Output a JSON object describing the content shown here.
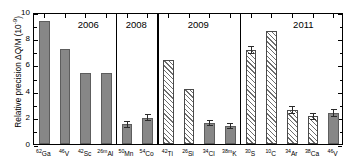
{
  "chart_data": {
    "type": "bar",
    "title": "",
    "xlabel": "",
    "ylabel": "Relative precision ΔQ/M (10⁻⁹)",
    "ylabel_text": "Relative precision ΔQ/M (10",
    "ylabel_exponent": "-9",
    "ylabel_suffix": ")",
    "ylim": [
      0,
      10
    ],
    "yticks": [
      0,
      2,
      4,
      6,
      8,
      10
    ],
    "ytick_labels": [
      "0",
      "2",
      "4",
      "6",
      "8",
      "10"
    ],
    "grid": false,
    "legend": "none",
    "categories": [
      "62Ga",
      "46V",
      "42Sc",
      "26mAl",
      "50Mn",
      "54Co",
      "42Ti",
      "26Si",
      "34Cl",
      "38mK",
      "30S",
      "10C",
      "34Ar",
      "38Ca",
      "46V"
    ],
    "values": [
      9.35,
      7.2,
      5.35,
      5.35,
      1.5,
      2.0,
      6.35,
      4.2,
      1.6,
      1.35,
      7.1,
      8.55,
      2.6,
      2.1,
      2.35
    ],
    "errors": [
      0,
      0,
      0,
      0,
      0.28,
      0.28,
      0,
      0,
      0.25,
      0.25,
      0.3,
      0,
      0.3,
      0.28,
      0.3
    ],
    "bar_styles": [
      "solid",
      "solid",
      "solid",
      "solid",
      "solid",
      "solid",
      "hatch",
      "hatch",
      "solid",
      "solid",
      "hatch",
      "hatch",
      "hatch",
      "hatch",
      "solid"
    ],
    "groups": [
      {
        "year": "2006",
        "start": 0,
        "end": 3
      },
      {
        "year": "2008",
        "start": 4,
        "end": 5
      },
      {
        "year": "2009",
        "start": 6,
        "end": 9
      },
      {
        "year": "2011",
        "start": 10,
        "end": 14
      }
    ],
    "bars": [
      {
        "mass": "62",
        "element": "Ga",
        "value": 9.35,
        "error": 0,
        "style": "solid",
        "group": "2006"
      },
      {
        "mass": "46",
        "element": "V",
        "value": 7.2,
        "error": 0,
        "style": "solid",
        "group": "2006"
      },
      {
        "mass": "42",
        "element": "Sc",
        "value": 5.35,
        "error": 0,
        "style": "solid",
        "group": "2006"
      },
      {
        "mass": "26m",
        "element": "Al",
        "value": 5.35,
        "error": 0,
        "style": "solid",
        "group": "2006"
      },
      {
        "mass": "50",
        "element": "Mn",
        "value": 1.5,
        "error": 0.28,
        "style": "solid",
        "group": "2008"
      },
      {
        "mass": "54",
        "element": "Co",
        "value": 2.0,
        "error": 0.28,
        "style": "solid",
        "group": "2008"
      },
      {
        "mass": "42",
        "element": "Ti",
        "value": 6.35,
        "error": 0,
        "style": "hatch",
        "group": "2009"
      },
      {
        "mass": "26",
        "element": "Si",
        "value": 4.2,
        "error": 0,
        "style": "hatch",
        "group": "2009"
      },
      {
        "mass": "34",
        "element": "Cl",
        "value": 1.6,
        "error": 0.25,
        "style": "solid",
        "group": "2009"
      },
      {
        "mass": "38m",
        "element": "K",
        "value": 1.35,
        "error": 0.25,
        "style": "solid",
        "group": "2009"
      },
      {
        "mass": "30",
        "element": "S",
        "value": 7.1,
        "error": 0.3,
        "style": "hatch",
        "group": "2011"
      },
      {
        "mass": "10",
        "element": "C",
        "value": 8.55,
        "error": 0,
        "style": "hatch",
        "group": "2011"
      },
      {
        "mass": "34",
        "element": "Ar",
        "value": 2.6,
        "error": 0.3,
        "style": "hatch",
        "group": "2011"
      },
      {
        "mass": "38",
        "element": "Ca",
        "value": 2.1,
        "error": 0.28,
        "style": "hatch",
        "group": "2011"
      },
      {
        "mass": "46",
        "element": "V",
        "value": 2.35,
        "error": 0.3,
        "style": "solid",
        "group": "2011"
      }
    ],
    "colors": {
      "solid_fill": "#878787",
      "hatch_line": "#6e6e6e",
      "axis": "#000000",
      "background": "#ffffff"
    }
  }
}
